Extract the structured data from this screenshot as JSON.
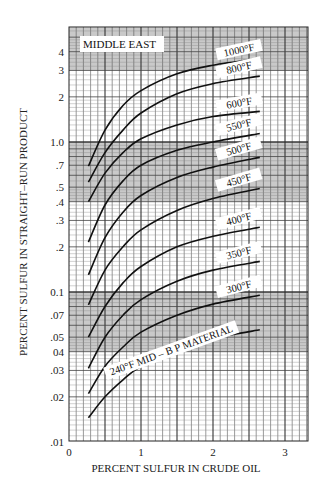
{
  "chart_data": {
    "type": "line",
    "title": "",
    "region_label": "MIDDLE EAST",
    "xlabel": "PERCENT SULFUR IN CRUDE OIL",
    "ylabel": "PERCENT SULFUR IN STRAIGHT–RUN PRODUCT",
    "xlim": [
      0,
      3.3
    ],
    "ylim": [
      0.01,
      5.8
    ],
    "yscale": "log",
    "grid": true,
    "x_ticks": [
      {
        "value": 0,
        "label": "0"
      },
      {
        "value": 1,
        "label": "1"
      },
      {
        "value": 2,
        "label": "2"
      },
      {
        "value": 3,
        "label": "3"
      }
    ],
    "y_ticks": [
      {
        "value": 4,
        "label": "4"
      },
      {
        "value": 3,
        "label": "3"
      },
      {
        "value": 2,
        "label": "2"
      },
      {
        "value": 1.0,
        "label": "1.0"
      },
      {
        "value": 0.7,
        "label": ".7"
      },
      {
        "value": 0.5,
        "label": ".5"
      },
      {
        "value": 0.4,
        "label": ".4"
      },
      {
        "value": 0.3,
        "label": ".3"
      },
      {
        "value": 0.2,
        "label": ".2"
      },
      {
        "value": 0.1,
        "label": "0.1"
      },
      {
        "value": 0.07,
        "label": ".07"
      },
      {
        "value": 0.05,
        "label": ".05"
      },
      {
        "value": 0.04,
        "label": "04"
      },
      {
        "value": 0.03,
        "label": ".03"
      },
      {
        "value": 0.02,
        "label": ".02"
      },
      {
        "value": 0.01,
        "label": ".01"
      }
    ],
    "shaded_bands": [
      {
        "from": 3.0,
        "to": 5.8
      },
      {
        "from": 0.4,
        "to": 1.0
      },
      {
        "from": 0.04,
        "to": 0.1
      }
    ],
    "x": [
      0.27,
      0.5,
      0.75,
      1.0,
      1.5,
      2.0,
      2.65
    ],
    "series": [
      {
        "name": "1000°F",
        "label": "1000°F",
        "values": [
          0.69,
          1.2,
          1.75,
          2.2,
          2.85,
          3.25,
          3.6
        ]
      },
      {
        "name": "800°F",
        "label": "800°F",
        "values": [
          0.54,
          0.85,
          1.2,
          1.56,
          2.1,
          2.45,
          2.75
        ]
      },
      {
        "name": "600°F",
        "label": "600°F",
        "values": [
          0.4,
          0.62,
          0.85,
          1.05,
          1.3,
          1.48,
          1.6
        ]
      },
      {
        "name": "550°F",
        "label": "550°F",
        "values": [
          0.215,
          0.38,
          0.55,
          0.7,
          0.88,
          1.0,
          1.14
        ]
      },
      {
        "name": "500°F",
        "label": "500°F",
        "values": [
          0.13,
          0.23,
          0.34,
          0.44,
          0.58,
          0.68,
          0.79
        ]
      },
      {
        "name": "450°F",
        "label": "450°F",
        "values": [
          0.082,
          0.14,
          0.2,
          0.26,
          0.35,
          0.42,
          0.49
        ]
      },
      {
        "name": "400°F",
        "label": "400°F",
        "values": [
          0.05,
          0.08,
          0.115,
          0.148,
          0.2,
          0.235,
          0.27
        ]
      },
      {
        "name": "350°F",
        "label": "350°F",
        "values": [
          0.031,
          0.05,
          0.07,
          0.089,
          0.118,
          0.14,
          0.16
        ]
      },
      {
        "name": "300°F",
        "label": "300°F",
        "values": [
          0.021,
          0.032,
          0.043,
          0.054,
          0.07,
          0.083,
          0.095
        ]
      },
      {
        "name": "240°F MID – B P MATERIAL",
        "label": "240°F MID – B P MATERIAL",
        "values": [
          0.0145,
          0.02,
          0.026,
          0.032,
          0.041,
          0.049,
          0.056
        ]
      }
    ]
  }
}
